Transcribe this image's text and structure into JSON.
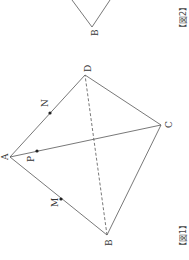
{
  "figure1": {
    "caption": "【図1】",
    "vertices": {
      "A": {
        "label": "A",
        "x": 10,
        "y": 157
      },
      "B": {
        "label": "B",
        "x": 107,
        "y": 235
      },
      "C": {
        "label": "C",
        "x": 161,
        "y": 125
      },
      "D": {
        "label": "D",
        "x": 85,
        "y": 75
      }
    },
    "points": {
      "M": {
        "label": "M",
        "x": 61,
        "y": 199
      },
      "N": {
        "label": "N",
        "x": 50,
        "y": 113
      },
      "P": {
        "label": "P",
        "x": 37,
        "y": 151
      }
    },
    "solid_edges": [
      "AB",
      "AC",
      "AD",
      "BC",
      "CD"
    ],
    "dashed_edges": [
      "BD"
    ]
  },
  "figure2": {
    "caption": "【図2】",
    "vertex_label": "B"
  },
  "colors": {
    "line": "#555555",
    "point": "#222222"
  }
}
